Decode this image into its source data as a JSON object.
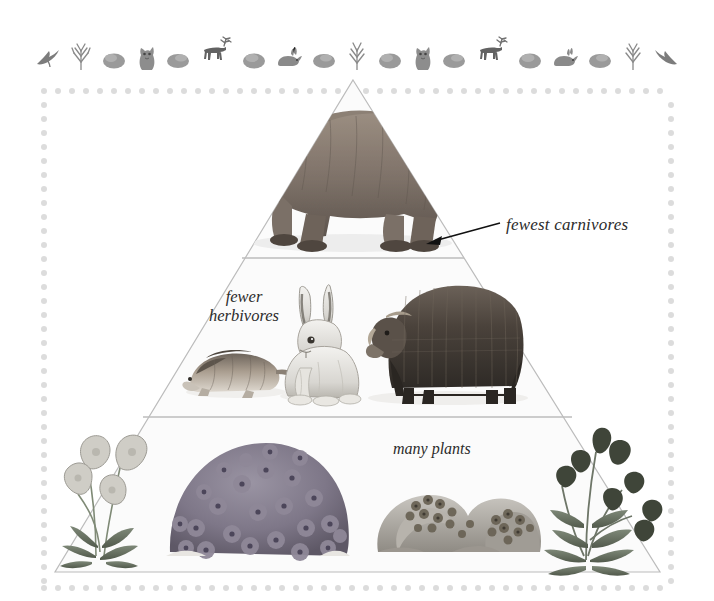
{
  "figure": {
    "type": "energy-pyramid",
    "background_color": "#ffffff",
    "frame": {
      "style": "dotted",
      "dot_color": "#dcdcdc",
      "left": 41,
      "top": 88,
      "right": 668,
      "bottom": 585,
      "spacing": 14
    }
  },
  "border_strip": {
    "name": "arctic animal border",
    "motifs": [
      "bird-icon",
      "twig-icon",
      "rock-icon",
      "arctic-fox-icon",
      "rock-icon",
      "caribou-icon",
      "rock-icon",
      "hare-icon",
      "rock-icon",
      "twig-icon",
      "rock-icon",
      "arctic-fox-icon",
      "rock-icon",
      "caribou-icon",
      "rock-icon",
      "hare-icon",
      "rock-icon",
      "twig-icon",
      "bird-icon"
    ]
  },
  "pyramid": {
    "apex": {
      "x": 353,
      "y": 80
    },
    "base_left": {
      "x": 55,
      "y": 572
    },
    "base_right": {
      "x": 660,
      "y": 572
    },
    "outline_color": "#b9b9b9",
    "fill_color": "#fbfbfb",
    "divider_color": "#bdbdbd",
    "tiers": [
      {
        "id": "tier-carnivores",
        "level": 3,
        "label": "fewest carnivores",
        "label_position": "right-annotation",
        "divider_y": 258,
        "organisms": [
          "grizzly-bear"
        ]
      },
      {
        "id": "tier-herbivores",
        "level": 2,
        "label": "fewer\nherbivores",
        "label_line_1": "fewer",
        "label_line_2": "herbivores",
        "label_position": "inside-left",
        "divider_y": 417,
        "organisms": [
          "lemming",
          "arctic-hare",
          "musk-ox"
        ]
      },
      {
        "id": "tier-plants",
        "level": 1,
        "label": "many plants",
        "label_position": "inside-center",
        "divider_y": 572,
        "organisms": [
          "arctic-poppy",
          "moss-campion",
          "lichen-covered-rocks",
          "arctic-willow"
        ]
      }
    ]
  },
  "annotation": {
    "text": "fewest carnivores",
    "arrow": {
      "from_x": 500,
      "from_y": 223,
      "to_x": 427,
      "to_y": 243,
      "color": "#111111",
      "head": "left"
    }
  },
  "labels": {
    "carnivores": "fewest carnivores",
    "herbivores_line1": "fewer",
    "herbivores_line2": "herbivores",
    "plants": "many plants"
  }
}
